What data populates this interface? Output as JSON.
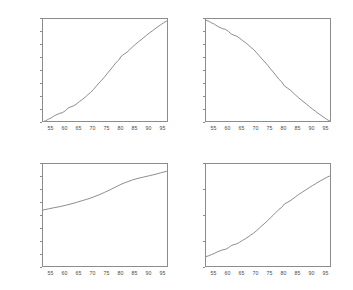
{
  "figure": {
    "width": 353,
    "height": 290,
    "background": "#ffffff",
    "line_color": "#707070",
    "axis_color": "#8c8c8c",
    "label_color": "#4a4a4a",
    "panel_count": 4,
    "layout": "2x2 grid of line plots"
  },
  "chart_data": [
    {
      "id": "top-left",
      "type": "line",
      "title": "",
      "xlabel": "",
      "ylabel": "",
      "grid": false,
      "legend": "none",
      "xlim": [
        52,
        97
      ],
      "ylim": [
        4.4,
        7.6
      ],
      "y_inverted": false,
      "xticks": [
        55,
        60,
        65,
        70,
        75,
        80,
        85,
        90,
        95
      ],
      "xtick_labels": [
        "55",
        "60",
        "65",
        "70",
        "75",
        "80",
        "85",
        "90",
        "95"
      ],
      "xminor_step": 1,
      "yticks": [
        4.4,
        4.8,
        5.2,
        5.6,
        6.0,
        6.4,
        6.8,
        7.2,
        7.6
      ],
      "ytick_labels": [
        "4.4",
        "4.8",
        "5.2",
        "5.6",
        "6.0",
        "6.4",
        "6.8",
        "7.2",
        "7.6"
      ],
      "series": [
        {
          "name": "series-1",
          "x": [
            52,
            53,
            54,
            55,
            56,
            57,
            58,
            59,
            60,
            61,
            62,
            63,
            64,
            65,
            66,
            67,
            68,
            69,
            70,
            71,
            72,
            73,
            74,
            75,
            76,
            77,
            78,
            79,
            80,
            81,
            82,
            83,
            84,
            85,
            86,
            87,
            88,
            89,
            90,
            91,
            92,
            93,
            94,
            95,
            96,
            97
          ],
          "values": [
            4.44,
            4.47,
            4.52,
            4.56,
            4.62,
            4.66,
            4.7,
            4.72,
            4.78,
            4.86,
            4.9,
            4.93,
            4.99,
            5.06,
            5.12,
            5.19,
            5.27,
            5.34,
            5.43,
            5.53,
            5.63,
            5.72,
            5.82,
            5.93,
            6.03,
            6.14,
            6.25,
            6.33,
            6.46,
            6.52,
            6.58,
            6.66,
            6.74,
            6.82,
            6.89,
            6.96,
            7.03,
            7.1,
            7.17,
            7.23,
            7.3,
            7.36,
            7.42,
            7.48,
            7.53,
            7.57
          ]
        }
      ]
    },
    {
      "id": "top-right",
      "type": "line",
      "title": "",
      "xlabel": "",
      "ylabel": "",
      "grid": false,
      "legend": "none",
      "xlim": [
        52,
        97
      ],
      "ylim": [
        4.4,
        7.6
      ],
      "y_inverted": true,
      "xticks": [
        55,
        60,
        65,
        70,
        75,
        80,
        85,
        90,
        95
      ],
      "xtick_labels": [
        "55",
        "60",
        "65",
        "70",
        "75",
        "80",
        "85",
        "90",
        "95"
      ],
      "xminor_step": 1,
      "yticks": [
        4.4,
        4.8,
        5.2,
        5.6,
        6.0,
        6.4,
        6.8,
        7.2,
        7.6
      ],
      "ytick_labels": [
        "4.4",
        "4.8",
        "5.2",
        "5.6",
        "6.0",
        "6.4",
        "6.8",
        "7.2",
        "7.6"
      ],
      "series": [
        {
          "name": "series-1",
          "x": [
            52,
            53,
            54,
            55,
            56,
            57,
            58,
            59,
            60,
            61,
            62,
            63,
            64,
            65,
            66,
            67,
            68,
            69,
            70,
            71,
            72,
            73,
            74,
            75,
            76,
            77,
            78,
            79,
            80,
            81,
            82,
            83,
            84,
            85,
            86,
            87,
            88,
            89,
            90,
            91,
            92,
            93,
            94,
            95,
            96,
            97
          ],
          "values": [
            4.44,
            4.47,
            4.52,
            4.56,
            4.62,
            4.66,
            4.7,
            4.72,
            4.78,
            4.86,
            4.9,
            4.93,
            4.99,
            5.06,
            5.12,
            5.19,
            5.27,
            5.34,
            5.43,
            5.53,
            5.63,
            5.72,
            5.82,
            5.93,
            6.03,
            6.14,
            6.25,
            6.33,
            6.46,
            6.52,
            6.58,
            6.66,
            6.74,
            6.82,
            6.89,
            6.96,
            7.03,
            7.1,
            7.17,
            7.23,
            7.3,
            7.36,
            7.42,
            7.48,
            7.53,
            7.57
          ]
        }
      ]
    },
    {
      "id": "bottom-left",
      "type": "line",
      "title": "",
      "xlabel": "",
      "ylabel": "",
      "grid": false,
      "legend": "none",
      "xlim": [
        52,
        97
      ],
      "ylim": [
        0,
        8
      ],
      "y_inverted": false,
      "xticks": [
        55,
        60,
        65,
        70,
        75,
        80,
        85,
        90,
        95
      ],
      "xtick_labels": [
        "55",
        "60",
        "65",
        "70",
        "75",
        "80",
        "85",
        "90",
        "95"
      ],
      "xminor_step": 1,
      "yticks": [
        0,
        1,
        2,
        3,
        4,
        5,
        6,
        7,
        8
      ],
      "ytick_labels": [
        "0",
        "1",
        "2",
        "3",
        "4",
        "5",
        "6",
        "7",
        "8"
      ],
      "series": [
        {
          "name": "series-1",
          "x": [
            52,
            54,
            56,
            58,
            60,
            62,
            64,
            66,
            68,
            70,
            72,
            74,
            76,
            78,
            80,
            82,
            84,
            86,
            88,
            90,
            92,
            94,
            96,
            97
          ],
          "values": [
            4.46,
            4.55,
            4.64,
            4.72,
            4.82,
            4.93,
            5.05,
            5.18,
            5.31,
            5.46,
            5.63,
            5.82,
            6.02,
            6.24,
            6.45,
            6.62,
            6.78,
            6.9,
            7.0,
            7.1,
            7.2,
            7.32,
            7.43,
            7.47
          ]
        }
      ]
    },
    {
      "id": "bottom-right",
      "type": "line",
      "title": "",
      "xlabel": "",
      "ylabel": "",
      "grid": false,
      "legend": "none",
      "xlim": [
        52,
        97
      ],
      "ylim": [
        4,
        8
      ],
      "y_inverted": false,
      "xticks": [
        55,
        60,
        65,
        70,
        75,
        80,
        85,
        90,
        95
      ],
      "xtick_labels": [
        "55",
        "60",
        "65",
        "70",
        "75",
        "80",
        "85",
        "90",
        "95"
      ],
      "xminor_step": 1,
      "yticks": [
        4,
        5,
        6,
        7,
        8
      ],
      "ytick_labels": [
        "4",
        "5",
        "6",
        "7",
        "8"
      ],
      "series": [
        {
          "name": "series-1",
          "x": [
            52,
            53,
            54,
            55,
            56,
            57,
            58,
            59,
            60,
            61,
            62,
            63,
            64,
            65,
            66,
            67,
            68,
            69,
            70,
            71,
            72,
            73,
            74,
            75,
            76,
            77,
            78,
            79,
            80,
            81,
            82,
            83,
            84,
            85,
            86,
            87,
            88,
            89,
            90,
            91,
            92,
            93,
            94,
            95,
            96,
            97
          ],
          "values": [
            4.44,
            4.47,
            4.52,
            4.56,
            4.62,
            4.66,
            4.7,
            4.72,
            4.78,
            4.86,
            4.9,
            4.93,
            4.99,
            5.06,
            5.12,
            5.19,
            5.27,
            5.34,
            5.43,
            5.53,
            5.63,
            5.72,
            5.82,
            5.93,
            6.03,
            6.14,
            6.25,
            6.33,
            6.46,
            6.52,
            6.58,
            6.66,
            6.74,
            6.82,
            6.89,
            6.96,
            7.03,
            7.1,
            7.17,
            7.23,
            7.3,
            7.36,
            7.42,
            7.48,
            7.53,
            7.57
          ]
        }
      ]
    }
  ]
}
